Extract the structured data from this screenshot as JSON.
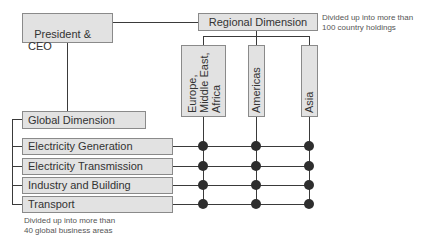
{
  "president": {
    "label": "President &\nCEO"
  },
  "regional": {
    "label": "Regional Dimension",
    "note": "Divided up into more than\n100 country holdings",
    "regions": [
      {
        "label": "Europe,\nMiddle East,\nAfrica"
      },
      {
        "label": "Americas"
      },
      {
        "label": "Asia"
      }
    ]
  },
  "global": {
    "label": "Global Dimension",
    "note": "Divided up into more than\n40 global business areas",
    "sectors": [
      {
        "label": "Electricity Generation"
      },
      {
        "label": "Electricity Transmission"
      },
      {
        "label": "Industry and Building"
      },
      {
        "label": "Transport"
      }
    ]
  },
  "colors": {
    "box_fill": "#e2e2e2",
    "box_border": "#8a8a8a",
    "line": "#3a3a3a",
    "node": "#2e2e2e"
  }
}
